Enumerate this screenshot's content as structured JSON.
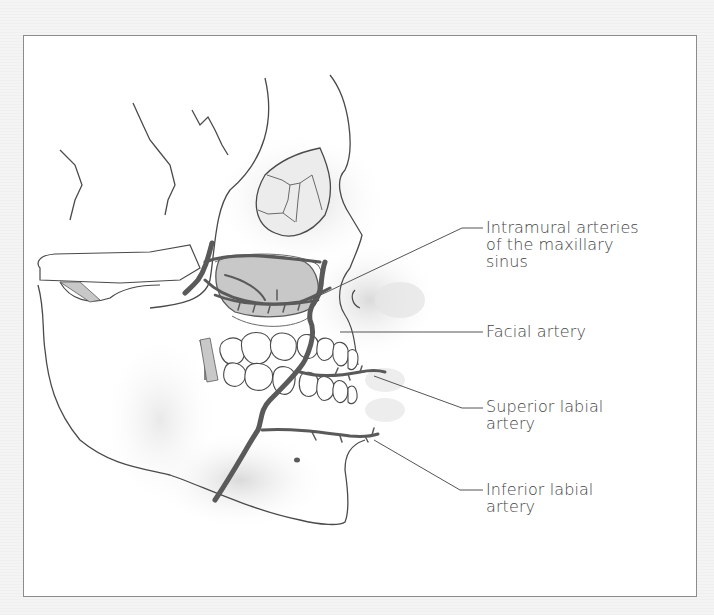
{
  "figure": {
    "type": "anatomical illustration",
    "colors": {
      "background": "#f4f4f4",
      "panel": "#ffffff",
      "panel_border": "#8c8c8c",
      "artery": "#5a5a5a",
      "bone_outline": "#4a4a4a",
      "sinus_fill": "#c8c8c8",
      "label_text": "#444444"
    }
  },
  "labels": [
    {
      "id": "intramural",
      "lines": [
        "Intramural arteries",
        "of the maxillary",
        "sinus"
      ]
    },
    {
      "id": "facial",
      "lines": [
        "Facial artery"
      ]
    },
    {
      "id": "superior-labial",
      "lines": [
        "Superior labial",
        "artery"
      ]
    },
    {
      "id": "inferior-labial",
      "lines": [
        "Inferior labial",
        "artery"
      ]
    }
  ]
}
